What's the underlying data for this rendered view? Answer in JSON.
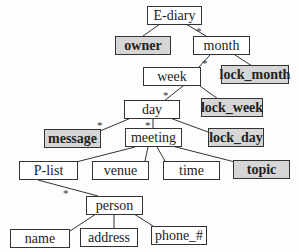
{
  "diagram": {
    "type": "tree",
    "nodes": {
      "ediary": {
        "label": "E-diary",
        "shaded": false
      },
      "owner": {
        "label": "owner",
        "shaded": true
      },
      "month": {
        "label": "month",
        "shaded": false
      },
      "week": {
        "label": "week",
        "shaded": false
      },
      "lock_month": {
        "label": "lock_month",
        "shaded": true
      },
      "day": {
        "label": "day",
        "shaded": false
      },
      "lock_week": {
        "label": "lock_week",
        "shaded": true
      },
      "message": {
        "label": "message",
        "shaded": true
      },
      "meeting": {
        "label": "meeting",
        "shaded": false
      },
      "lock_day": {
        "label": "lock_day",
        "shaded": true
      },
      "plist": {
        "label": "P-list",
        "shaded": false
      },
      "venue": {
        "label": "venue",
        "shaded": false
      },
      "time": {
        "label": "time",
        "shaded": false
      },
      "topic": {
        "label": "topic",
        "shaded": true
      },
      "person": {
        "label": "person",
        "shaded": false
      },
      "name": {
        "label": "name",
        "shaded": false
      },
      "address": {
        "label": "address",
        "shaded": false
      },
      "phone": {
        "label": "phone_#",
        "shaded": false
      }
    },
    "edges": [
      {
        "from": "E-diary",
        "to": "owner",
        "multiplicity": ""
      },
      {
        "from": "E-diary",
        "to": "month",
        "multiplicity": "*"
      },
      {
        "from": "month",
        "to": "week",
        "multiplicity": "*"
      },
      {
        "from": "month",
        "to": "lock_month",
        "multiplicity": ""
      },
      {
        "from": "week",
        "to": "day",
        "multiplicity": "*"
      },
      {
        "from": "week",
        "to": "lock_week",
        "multiplicity": ""
      },
      {
        "from": "day",
        "to": "message",
        "multiplicity": "*"
      },
      {
        "from": "day",
        "to": "meeting",
        "multiplicity": "*"
      },
      {
        "from": "day",
        "to": "lock_day",
        "multiplicity": ""
      },
      {
        "from": "meeting",
        "to": "P-list",
        "multiplicity": ""
      },
      {
        "from": "meeting",
        "to": "venue",
        "multiplicity": ""
      },
      {
        "from": "meeting",
        "to": "time",
        "multiplicity": ""
      },
      {
        "from": "meeting",
        "to": "topic",
        "multiplicity": ""
      },
      {
        "from": "P-list",
        "to": "person",
        "multiplicity": "*"
      },
      {
        "from": "person",
        "to": "name",
        "multiplicity": ""
      },
      {
        "from": "person",
        "to": "address",
        "multiplicity": ""
      },
      {
        "from": "person",
        "to": "phone_#",
        "multiplicity": ""
      }
    ],
    "star_symbol": "*"
  }
}
